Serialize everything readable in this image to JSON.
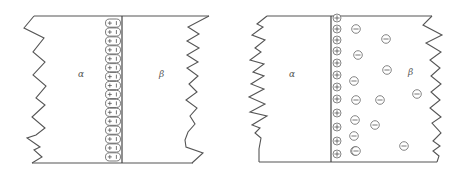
{
  "figure": {
    "panels": [
      {
        "id": "left",
        "model": "compact dipole layer",
        "phase_left_label": "α",
        "phase_right_label": "β",
        "dipole_count": 16,
        "dipole_plus_sign": "+",
        "dipole_minus_sign": "−"
      },
      {
        "id": "right",
        "model": "diffuse double layer",
        "phase_left_label": "α",
        "phase_right_label": "β",
        "positive_charge_count": 12,
        "negative_charge_count": 14,
        "positive_sign": "+",
        "negative_sign": "−"
      }
    ],
    "colors": {
      "line": "#555555",
      "background": "#ffffff"
    }
  }
}
